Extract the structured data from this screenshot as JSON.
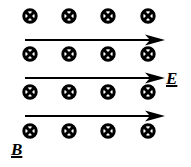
{
  "figure": {
    "magnetic_field": {
      "label": "B",
      "direction": "into-page",
      "symbol": "circle-cross-icon",
      "rows": 4,
      "columns": 4
    },
    "electric_field": {
      "label": "E",
      "direction": "right",
      "arrow_count": 3,
      "symbol": "arrow-right-icon"
    },
    "colors": {
      "ink": "#000000",
      "background": "#ffffff"
    }
  }
}
